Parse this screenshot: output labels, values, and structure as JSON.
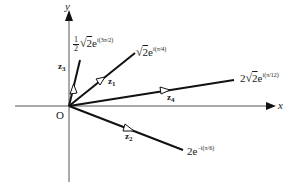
{
  "diagram": {
    "type": "argand-diagram",
    "colors": {
      "axis": "#555555",
      "vector": "#111111",
      "text": "#1a1a1a",
      "background": "#ffffff"
    },
    "axes": {
      "x_label": "x",
      "y_label": "y",
      "origin_label": "O"
    },
    "vectors": [
      {
        "id": "z1",
        "name": "z",
        "subscript": "1",
        "expression": {
          "coef": "",
          "radical": "2",
          "base": "e",
          "exponent": "i(π/4)"
        }
      },
      {
        "id": "z2",
        "name": "z",
        "subscript": "2",
        "expression": {
          "coef": "2",
          "radical": "",
          "base": "e",
          "exponent": "−i(π/6)"
        }
      },
      {
        "id": "z3",
        "name": "z",
        "subscript": "3",
        "expression": {
          "coef_num": "1",
          "coef_den": "2",
          "radical": "2",
          "base": "e",
          "exponent": "i(3π/2)"
        }
      },
      {
        "id": "z4",
        "name": "z",
        "subscript": "4",
        "expression": {
          "coef": "2",
          "radical": "2",
          "base": "e",
          "exponent": "i(π/12)"
        }
      }
    ]
  }
}
